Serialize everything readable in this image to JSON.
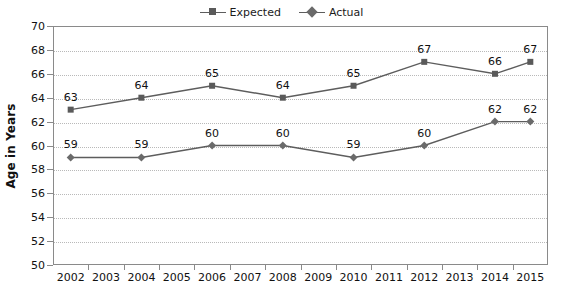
{
  "chart_data": {
    "type": "line",
    "title": "",
    "xlabel": "",
    "ylabel": "Age in Years",
    "ylim": [
      50,
      70
    ],
    "ytick_step": 2,
    "yticks": [
      50,
      52,
      54,
      56,
      58,
      60,
      62,
      64,
      66,
      68,
      70
    ],
    "grid": true,
    "legend_position": "top-center",
    "categories": [
      "2002",
      "2003",
      "2004",
      "2005",
      "2006",
      "2007",
      "2008",
      "2009",
      "2010",
      "2011",
      "2012",
      "2013",
      "2014",
      "2015"
    ],
    "series": [
      {
        "name": "Expected",
        "marker": "square",
        "color": "#5a5a5a",
        "x": [
          "2002",
          "2004",
          "2006",
          "2008",
          "2010",
          "2012",
          "2014",
          "2015"
        ],
        "values": [
          63,
          64,
          65,
          64,
          65,
          67,
          66,
          67
        ],
        "labels": [
          "63",
          "64",
          "65",
          "64",
          "65",
          "67",
          "66",
          "67"
        ]
      },
      {
        "name": "Actual",
        "marker": "diamond",
        "color": "#6a6a6a",
        "x": [
          "2002",
          "2004",
          "2006",
          "2008",
          "2010",
          "2012",
          "2014",
          "2015"
        ],
        "values": [
          59,
          59,
          60,
          60,
          59,
          60,
          62,
          62
        ],
        "labels": [
          "59",
          "59",
          "60",
          "60",
          "59",
          "60",
          "62",
          "62"
        ]
      }
    ]
  },
  "legend": {
    "items": [
      {
        "label": "Expected",
        "marker": "square"
      },
      {
        "label": "Actual",
        "marker": "diamond"
      }
    ]
  },
  "axes": {
    "y_title": "Age in Years"
  },
  "colors": {
    "line": "#5d5d5d",
    "expected_marker": "#5a5a5a",
    "actual_marker": "#6a6a6a",
    "grid": "#b9b9b9",
    "axis": "#8a8a8a",
    "text": "#111111",
    "background": "#ffffff"
  }
}
